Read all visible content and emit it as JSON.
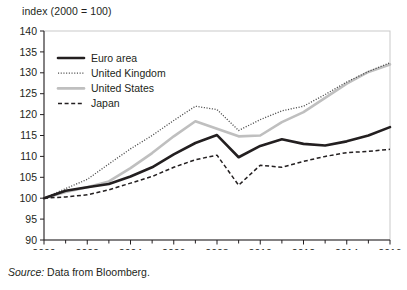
{
  "axis_label": "index (2000 = 100)",
  "source": {
    "prefix": "Source:",
    "text": " Data from Bloomberg."
  },
  "colors": {
    "euro_area": "#231f20",
    "united_kingdom": "#4d4d4d",
    "united_states": "#bfbfbf",
    "japan": "#231f20",
    "axis": "#231f20",
    "frame": "#c9c9c9",
    "background": "#ffffff"
  },
  "chart_data": {
    "type": "line",
    "title": "",
    "subtitle": "",
    "xlabel": "",
    "ylabel": "index (2000 = 100)",
    "xlim": [
      2000,
      2016
    ],
    "ylim": [
      90,
      140
    ],
    "ytick_step": 5,
    "yticks": [
      90,
      95,
      100,
      105,
      110,
      115,
      120,
      125,
      130,
      135,
      140
    ],
    "xticks_major": [
      2000,
      2002,
      2004,
      2006,
      2008,
      2010,
      2012,
      2014,
      2016
    ],
    "xticks_minor": [
      2001,
      2003,
      2005,
      2007,
      2009,
      2011,
      2013,
      2015
    ],
    "grid": false,
    "legend_position": "top-left",
    "x": [
      2000,
      2001,
      2002,
      2003,
      2004,
      2005,
      2006,
      2007,
      2008,
      2009,
      2010,
      2011,
      2012,
      2013,
      2014,
      2015,
      2016
    ],
    "series": [
      {
        "name": "Euro area",
        "style": "solid-thick",
        "color": "#231f20",
        "values": [
          100.0,
          101.8,
          102.6,
          103.4,
          105.2,
          107.4,
          110.5,
          113.2,
          115.1,
          109.8,
          112.5,
          114.1,
          113.0,
          112.6,
          113.6,
          115.0,
          117.0
        ]
      },
      {
        "name": "United Kingdom",
        "style": "dotted",
        "color": "#4d4d4d",
        "values": [
          100.0,
          102.3,
          104.5,
          108.2,
          111.8,
          115.0,
          118.6,
          122.0,
          121.2,
          116.2,
          118.8,
          120.9,
          122.0,
          124.8,
          127.8,
          130.3,
          132.4
        ]
      },
      {
        "name": "United States",
        "style": "solid-thick",
        "color": "#bfbfbf",
        "values": [
          100.0,
          101.5,
          102.6,
          104.0,
          107.2,
          110.8,
          114.8,
          118.4,
          116.6,
          114.8,
          115.0,
          118.2,
          120.6,
          124.0,
          127.4,
          130.2,
          132.0
        ]
      },
      {
        "name": "Japan",
        "style": "dashed",
        "color": "#231f20",
        "values": [
          100.0,
          100.3,
          100.8,
          102.0,
          103.6,
          105.2,
          107.4,
          109.2,
          110.3,
          103.1,
          107.9,
          107.4,
          108.8,
          110.0,
          110.9,
          111.2,
          111.7
        ]
      }
    ]
  }
}
